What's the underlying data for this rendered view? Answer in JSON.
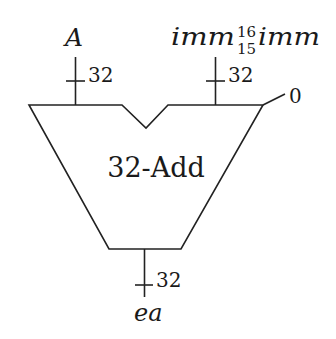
{
  "diagram": {
    "type": "adder-block",
    "block": {
      "label": "32-Add",
      "shape": "trapezoid-with-notch"
    },
    "inputs": [
      {
        "name": "A",
        "width_label": "32"
      },
      {
        "name_main": "imm",
        "sup": "16",
        "sub": "15",
        "name_tail": "imm",
        "width_label": "32"
      }
    ],
    "carry_in": {
      "value": "0"
    },
    "output": {
      "name": "ea",
      "width_label": "32"
    },
    "colors": {
      "stroke": "#222222",
      "text": "#1a1a1a",
      "background": "#ffffff"
    }
  }
}
